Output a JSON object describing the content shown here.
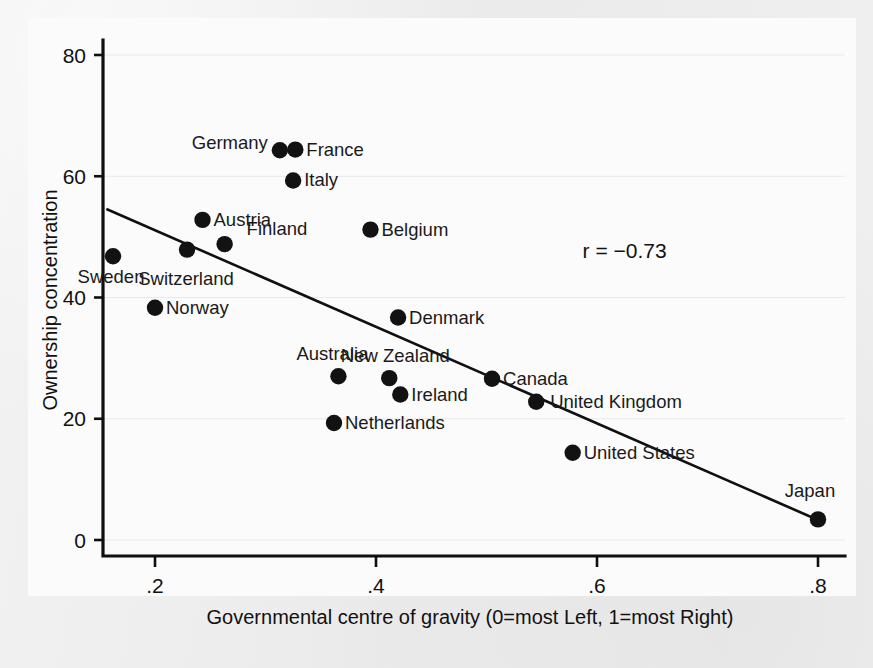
{
  "chart_data": {
    "type": "scatter",
    "title": "",
    "xlabel": "Governmental centre of gravity (0=most Left, 1=most Right)",
    "ylabel": "Ownership concentration",
    "xlim": [
      0.145,
      0.838
    ],
    "ylim": [
      -2.5,
      84
    ],
    "xticks": [
      0.2,
      0.4,
      0.6,
      0.8
    ],
    "xtick_labels": [
      ".2",
      ".4",
      ".6",
      ".8"
    ],
    "yticks": [
      0,
      20,
      40,
      60,
      80
    ],
    "ytick_labels": [
      "0",
      "20",
      "40",
      "60",
      "80"
    ],
    "grid": false,
    "legend": null,
    "annotations": [
      {
        "name": "correlation",
        "text": "r = −0.73",
        "x": 0.625,
        "y": 46.5
      }
    ],
    "fit_line": {
      "name": "regression-line",
      "x": [
        0.156,
        0.8
      ],
      "y": [
        54.6,
        3.3
      ]
    },
    "points": [
      {
        "label": "Sweden",
        "x": 0.162,
        "y": 46.8,
        "label_dx": -2,
        "label_dy": 27,
        "label_anchor": "middle"
      },
      {
        "label": "Norway",
        "x": 0.2,
        "y": 38.3,
        "label_dx": 11,
        "label_dy": 6,
        "label_anchor": "start"
      },
      {
        "label": "Switzerland",
        "x": 0.229,
        "y": 47.9,
        "label_dx": -1,
        "label_dy": 35,
        "label_anchor": "middle"
      },
      {
        "label": "Austria",
        "x": 0.243,
        "y": 52.8,
        "label_dx": 11,
        "label_dy": 6,
        "label_anchor": "start"
      },
      {
        "label": "Finland",
        "x": 0.263,
        "y": 48.8,
        "label_dx": 22,
        "label_dy": -9,
        "label_anchor": "start"
      },
      {
        "label": "Germany",
        "x": 0.313,
        "y": 64.3,
        "label_dx": -12,
        "label_dy": -1,
        "label_anchor": "end"
      },
      {
        "label": "France",
        "x": 0.327,
        "y": 64.4,
        "label_dx": 11,
        "label_dy": 6,
        "label_anchor": "start"
      },
      {
        "label": "Italy",
        "x": 0.325,
        "y": 59.3,
        "label_dx": 11,
        "label_dy": 6,
        "label_anchor": "start"
      },
      {
        "label": "Belgium",
        "x": 0.395,
        "y": 51.2,
        "label_dx": 11,
        "label_dy": 6,
        "label_anchor": "start"
      },
      {
        "label": "Denmark",
        "x": 0.42,
        "y": 36.7,
        "label_dx": 11,
        "label_dy": 6,
        "label_anchor": "start"
      },
      {
        "label": "Australia",
        "x": 0.366,
        "y": 27.0,
        "label_dx": -6,
        "label_dy": -16,
        "label_anchor": "middle"
      },
      {
        "label": "New Zealand",
        "x": 0.412,
        "y": 26.7,
        "label_dx": 6,
        "label_dy": -16,
        "label_anchor": "middle"
      },
      {
        "label": "Ireland",
        "x": 0.422,
        "y": 24.0,
        "label_dx": 11,
        "label_dy": 6,
        "label_anchor": "start"
      },
      {
        "label": "Netherlands",
        "x": 0.362,
        "y": 19.3,
        "label_dx": 11,
        "label_dy": 6,
        "label_anchor": "start"
      },
      {
        "label": "Canada",
        "x": 0.505,
        "y": 26.6,
        "label_dx": 11,
        "label_dy": 6,
        "label_anchor": "start"
      },
      {
        "label": "United Kingdom",
        "x": 0.545,
        "y": 22.8,
        "label_dx": 14,
        "label_dy": 6,
        "label_anchor": "start"
      },
      {
        "label": "United States",
        "x": 0.578,
        "y": 14.4,
        "label_dx": 11,
        "label_dy": 6,
        "label_anchor": "start"
      },
      {
        "label": "Japan",
        "x": 0.8,
        "y": 3.4,
        "label_dx": -8,
        "label_dy": -22,
        "label_anchor": "middle"
      }
    ]
  }
}
